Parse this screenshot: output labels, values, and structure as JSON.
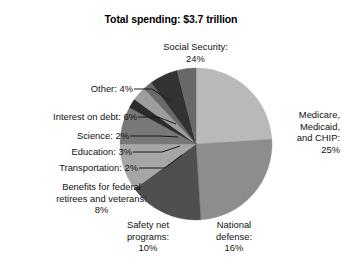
{
  "chart_data": {
    "type": "pie",
    "title": "Total spending: $3.7 trillion",
    "xlabel": "",
    "ylabel": "",
    "legend": "none",
    "grid": false,
    "units": "percent of total",
    "total": "$3.7 trillion",
    "start_angle_deg": 0,
    "direction": "clockwise",
    "categories": [
      "Social Security",
      "Medicare, Medicaid, and CHIP",
      "National defense",
      "Safety net programs",
      "Benefits for federal retirees and veterans",
      "Transportation",
      "Education",
      "Science",
      "Interest on debt",
      "Other"
    ],
    "values": [
      24,
      25,
      16,
      10,
      8,
      2,
      3,
      2,
      6,
      4
    ],
    "colors": [
      "#b9b9b9",
      "#8d8d8d",
      "#4f4f4f",
      "#a6a6a6",
      "#787878",
      "#2b2b2b",
      "#9d9d9d",
      "#6a6a6a",
      "#323232",
      "#686868"
    ],
    "slices": [
      {
        "label": "Social Security",
        "value": 24,
        "value_text": "24%",
        "color": "#b9b9b9"
      },
      {
        "label": "Medicare, Medicaid, and CHIP",
        "value": 25,
        "value_text": "25%",
        "color": "#8d8d8d"
      },
      {
        "label": "National defense",
        "value": 16,
        "value_text": "16%",
        "color": "#4f4f4f"
      },
      {
        "label": "Safety net programs",
        "value": 10,
        "value_text": "10%",
        "color": "#a6a6a6"
      },
      {
        "label": "Benefits for federal retirees and veterans",
        "value": 8,
        "value_text": "8%",
        "color": "#787878"
      },
      {
        "label": "Transportation",
        "value": 2,
        "value_text": "2%",
        "color": "#2b2b2b"
      },
      {
        "label": "Education",
        "value": 3,
        "value_text": "3%",
        "color": "#9d9d9d"
      },
      {
        "label": "Science",
        "value": 2,
        "value_text": "2%",
        "color": "#6a6a6a"
      },
      {
        "label": "Interest on debt",
        "value": 6,
        "value_text": "6%",
        "color": "#323232"
      },
      {
        "label": "Other",
        "value": 4,
        "value_text": "4%",
        "color": "#686868"
      }
    ]
  },
  "labels": {
    "social_security": "Social Security:\n24%",
    "medicare": "Medicare,\nMedicaid,\nand CHIP:\n25%",
    "national_defense": "National\ndefense:\n16%",
    "safety_net": "Safety net\nprograms:\n10%",
    "benefits": "Benefits for federal\nretirees and veterans:\n8%",
    "transportation": "Transportation: 2%",
    "education": "Education: 3%",
    "science": "Science: 2%",
    "interest": "Interest on debt: 6%",
    "other": "Other: 4%"
  }
}
